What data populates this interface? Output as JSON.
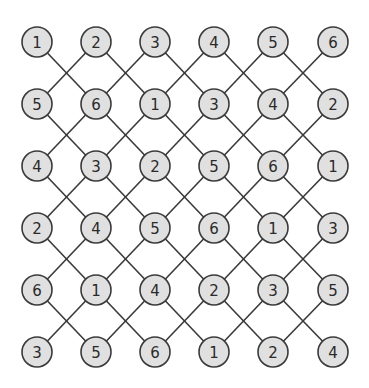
{
  "diagram": {
    "type": "lattice-grid",
    "rows": 6,
    "cols": 6,
    "grid": [
      [
        1,
        2,
        3,
        4,
        5,
        6
      ],
      [
        5,
        6,
        1,
        3,
        4,
        2
      ],
      [
        4,
        3,
        2,
        5,
        6,
        1
      ],
      [
        2,
        4,
        5,
        6,
        1,
        3
      ],
      [
        6,
        1,
        4,
        2,
        3,
        5
      ],
      [
        3,
        5,
        6,
        1,
        2,
        4
      ]
    ],
    "connections": "each node connects diagonally to its lower-left and lower-right neighbors in the next row",
    "layout": {
      "col_x": [
        37,
        96,
        155,
        214,
        273,
        333
      ],
      "row_y": [
        42,
        104,
        166,
        228,
        290,
        352
      ],
      "node_radius": 15
    },
    "colors": {
      "background": "#ffffff",
      "node_fill": "#e0e0e0",
      "node_stroke": "#3a3a3a",
      "line": "#3a3a3a",
      "text": "#2a2a2a"
    }
  }
}
